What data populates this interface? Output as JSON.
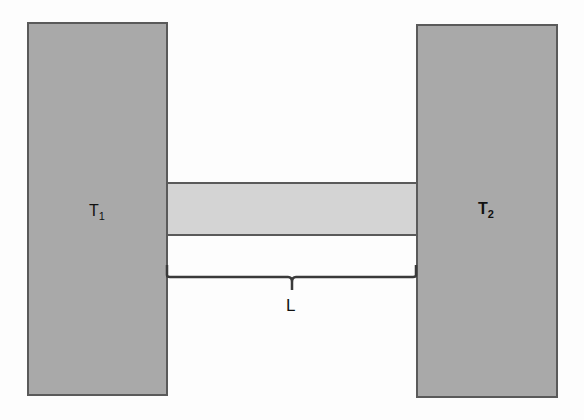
{
  "diagram": {
    "left_reservoir": {
      "label": "T",
      "subscript": "1",
      "color": "#a9a9a9"
    },
    "right_reservoir": {
      "label": "T",
      "subscript": "2",
      "color": "#a9a9a9"
    },
    "rod": {
      "color": "#d4d4d4"
    },
    "length_label": "L",
    "stroke_color": "#5a5a5a"
  }
}
